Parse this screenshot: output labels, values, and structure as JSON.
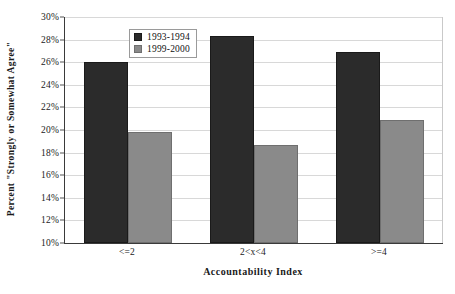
{
  "chart_data": {
    "type": "bar",
    "title": "",
    "subtitle": "",
    "xlabel": "Accountability Index",
    "ylabel": "Percent \"Strongly or Somewhat Agree\"",
    "categories": [
      "<=2",
      "2<x<4",
      ">=4"
    ],
    "series": [
      {
        "name": "1993-1994",
        "color": "#2b2b2b",
        "values": [
          26.0,
          28.3,
          26.9
        ]
      },
      {
        "name": "1999-2000",
        "color": "#8a8a8a",
        "values": [
          19.8,
          18.7,
          20.9
        ]
      }
    ],
    "ylim": [
      10,
      30
    ],
    "ytick_step": 2,
    "ytick_labels": [
      "30%",
      "28%",
      "26%",
      "24%",
      "22%",
      "20%",
      "18%",
      "16%",
      "14%",
      "12%",
      "10%"
    ],
    "ytick_values": [
      30,
      28,
      26,
      24,
      22,
      20,
      18,
      16,
      14,
      12,
      10
    ],
    "grid": true,
    "grid_axis": "y",
    "legend_position": "inside-top-center",
    "value_suffix": "%"
  },
  "legend": {
    "items": [
      {
        "label": "1993-1994"
      },
      {
        "label": "1999-2000"
      }
    ]
  },
  "axes": {
    "y_title": "Percent \"Strongly or Somewhat Agree\"",
    "x_title": "Accountability Index"
  }
}
